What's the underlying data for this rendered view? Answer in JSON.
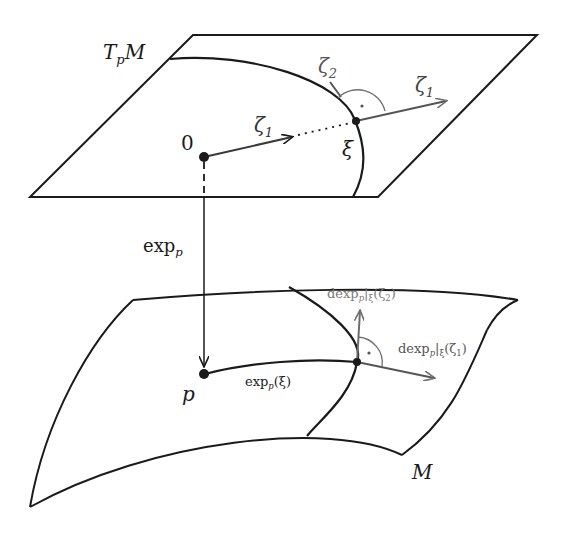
{
  "figure": {
    "colors": {
      "line": "#1a1a1a",
      "gray_vector": "#6e6e6e",
      "background": "#ffffff"
    }
  },
  "labels": {
    "tangent_space": {
      "main": "T",
      "sub": "p",
      "tail": "M"
    },
    "origin": "0",
    "zeta1_inner": {
      "main": "ζ",
      "sub": "1"
    },
    "zeta1_outer": {
      "main": "ζ",
      "sub": "1"
    },
    "zeta2": {
      "main": "ζ",
      "sub": "2"
    },
    "xi": "ξ",
    "exp_map": {
      "main": "exp",
      "sub": "p"
    },
    "point_p": "p",
    "exp_of_xi": {
      "main": "exp",
      "sub": "p",
      "tail": "(ξ)"
    },
    "dexp_zeta2": {
      "main": "dexp",
      "sub": "p",
      "mid": "|",
      "sub2": "ξ",
      "tail": "(ζ",
      "sub3": "2",
      "end": ")"
    },
    "dexp_zeta1": {
      "main": "dexp",
      "sub": "p",
      "mid": "|",
      "sub2": "ξ",
      "tail": "(ζ",
      "sub3": "1",
      "end": ")"
    },
    "manifold": "M"
  }
}
